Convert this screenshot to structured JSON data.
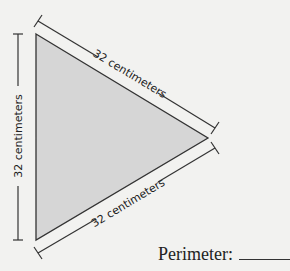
{
  "figure": {
    "shape": "triangle",
    "fill_color": "#d6d6d6",
    "stroke_color": "#333333",
    "background_color": "#f2f2f0",
    "vertices": [
      [
        36,
        34
      ],
      [
        208,
        138
      ],
      [
        36,
        240
      ]
    ],
    "side_labels": {
      "left": "32 centimeters",
      "top_right": "32 centimeters",
      "bottom_right": "32 centimeters"
    }
  },
  "question": {
    "prompt": "Perimeter:",
    "answer_blank": ""
  }
}
